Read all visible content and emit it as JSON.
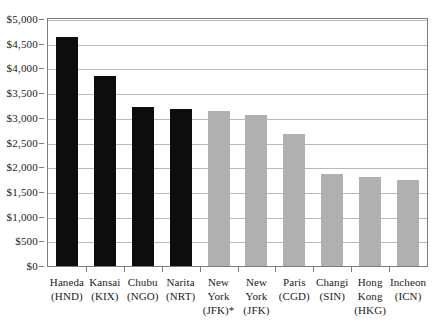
{
  "chart_data": {
    "type": "bar",
    "title": "",
    "subtitle": "",
    "xlabel": "",
    "ylabel": "",
    "ylim": [
      0,
      5000
    ],
    "ytick_step": 500,
    "grid": true,
    "legend": "none",
    "axis_tick_labels": [
      "$0",
      "$500",
      "$1,000",
      "$1,500",
      "$2,000",
      "$2,500",
      "$3,000",
      "$3,500",
      "$4,000",
      "$4,500",
      "$5,000"
    ],
    "currency_prefix": "$",
    "categories": [
      "Haneda (HND)",
      "Kansai (KIX)",
      "Chubu (NGO)",
      "Narita (NRT)",
      "New York (JFK)*",
      "New York (JFK)",
      "Paris (CGD)",
      "Changi (SIN)",
      "Hong Kong (HKG)",
      "Incheon (ICN)"
    ],
    "values": [
      4630,
      3850,
      3210,
      3185,
      3140,
      3050,
      2675,
      1860,
      1800,
      1735
    ],
    "colors": {
      "dark_bar": "#0d0d0d",
      "light_bar": "#b0b0b0",
      "gridline": "#b9b9b9",
      "axis": "#7d7d7d",
      "text": "#1a1a1a",
      "background": "#ffffff"
    },
    "bars": [
      {
        "name": "haneda",
        "label_lines": [
          "Haneda",
          "(HND)"
        ],
        "value": 4630,
        "color": "dark"
      },
      {
        "name": "kansai",
        "label_lines": [
          "Kansai",
          "(KIX)"
        ],
        "value": 3850,
        "color": "dark"
      },
      {
        "name": "chubu",
        "label_lines": [
          "Chubu",
          "(NGO)"
        ],
        "value": 3210,
        "color": "dark"
      },
      {
        "name": "narita",
        "label_lines": [
          "Narita",
          "(NRT)"
        ],
        "value": 3185,
        "color": "dark"
      },
      {
        "name": "jfk-star",
        "label_lines": [
          "New",
          "York",
          "(JFK)*"
        ],
        "value": 3140,
        "color": "light"
      },
      {
        "name": "jfk",
        "label_lines": [
          "New",
          "York",
          "(JFK)"
        ],
        "value": 3050,
        "color": "light"
      },
      {
        "name": "paris",
        "label_lines": [
          "Paris",
          "(CGD)"
        ],
        "value": 2675,
        "color": "light"
      },
      {
        "name": "changi",
        "label_lines": [
          "Changi",
          "(SIN)"
        ],
        "value": 1860,
        "color": "light"
      },
      {
        "name": "hongkong",
        "label_lines": [
          "Hong",
          "Kong",
          "(HKG)"
        ],
        "value": 1800,
        "color": "light"
      },
      {
        "name": "incheon",
        "label_lines": [
          "Incheon",
          "(ICN)"
        ],
        "value": 1735,
        "color": "light"
      }
    ]
  }
}
